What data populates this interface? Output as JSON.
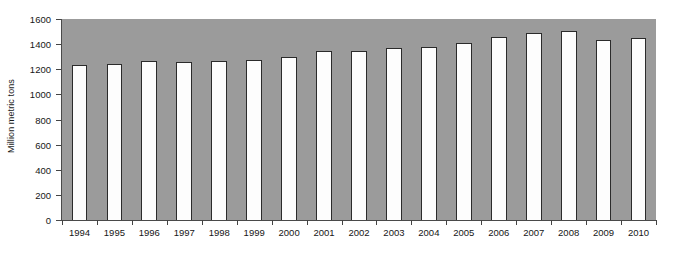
{
  "chart_data": {
    "type": "bar",
    "title": "",
    "subtitle": "",
    "xlabel": "",
    "ylabel": "Million metric tons",
    "categories": [
      "1994",
      "1995",
      "1996",
      "1997",
      "1998",
      "1999",
      "2000",
      "2001",
      "2002",
      "2003",
      "2004",
      "2005",
      "2006",
      "2007",
      "2008",
      "2009",
      "2010"
    ],
    "values": [
      1233,
      1241,
      1262,
      1257,
      1262,
      1272,
      1299,
      1347,
      1344,
      1370,
      1381,
      1412,
      1458,
      1487,
      1505,
      1432,
      1451
    ],
    "series": [
      {
        "name": "Million metric tons",
        "values": [
          1233,
          1241,
          1262,
          1257,
          1262,
          1272,
          1299,
          1347,
          1344,
          1370,
          1381,
          1412,
          1458,
          1487,
          1505,
          1432,
          1451
        ]
      }
    ],
    "ylim": [
      0,
      1600
    ],
    "ytick_step": 200,
    "yticks": [
      0,
      200,
      400,
      600,
      800,
      1000,
      1200,
      1400,
      1600
    ],
    "ytick_labels": [
      "0",
      "200",
      "400",
      "600",
      "800",
      "1000",
      "1200",
      "1400",
      "1600"
    ],
    "grid": false,
    "legend": false,
    "legend_position": "none",
    "annotations": [],
    "colors": {
      "plot_background": "#9b9b9b",
      "bar_fill": "#fdfdfd",
      "bar_outline": "#2b2b2b",
      "axis": "#4a4a4a",
      "text": "#161616",
      "page_background": "#ffffff"
    }
  }
}
